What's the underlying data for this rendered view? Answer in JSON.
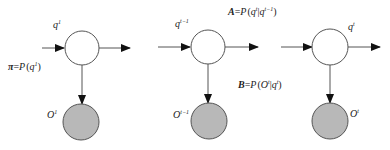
{
  "diagram": {
    "type": "hidden-markov-model",
    "colors": {
      "hidden_fill": "#ffffff",
      "observed_fill": "#b8b8b8",
      "stroke": "#555555",
      "arrow": "#111111"
    },
    "nodes": [
      {
        "id": "hidden-1",
        "label_base": "q",
        "label_sup": "1",
        "kind": "hidden",
        "cx": 82,
        "cy": 48,
        "r": 17
      },
      {
        "id": "observed-1",
        "label_base": "O",
        "label_sup": "1",
        "kind": "observed",
        "cx": 81,
        "cy": 122,
        "r": 18
      },
      {
        "id": "hidden-t-1",
        "label_base": "q",
        "label_sup": "t−1",
        "kind": "hidden",
        "cx": 208,
        "cy": 47,
        "r": 17
      },
      {
        "id": "observed-t-1",
        "label_base": "O",
        "label_sup": "t−1",
        "kind": "observed",
        "cx": 209,
        "cy": 121,
        "r": 18
      },
      {
        "id": "hidden-t",
        "label_base": "q",
        "label_sup": "t",
        "kind": "hidden",
        "cx": 330,
        "cy": 47,
        "r": 18
      },
      {
        "id": "observed-t",
        "label_base": "O",
        "label_sup": "t",
        "kind": "observed",
        "cx": 330,
        "cy": 121,
        "r": 18
      }
    ],
    "equations": {
      "initial": {
        "symbol": "π",
        "equals": "=",
        "func": "P",
        "open": "(",
        "arg_base": "q",
        "arg_sup": "1",
        "close": ")"
      },
      "transition": {
        "symbol": "A",
        "equals": "=",
        "func": "P",
        "open": "(",
        "arg1_base": "q",
        "arg1_sup": "t",
        "bar": "|",
        "arg2_base": "q",
        "arg2_sup": "t−1",
        "close": ")"
      },
      "emission": {
        "symbol": "B",
        "equals": "=",
        "func": "P",
        "open": "(",
        "arg1_base": "O",
        "arg1_sup": "t",
        "bar": "|",
        "arg2_base": "q",
        "arg2_sup": "t",
        "close": ")"
      }
    }
  }
}
